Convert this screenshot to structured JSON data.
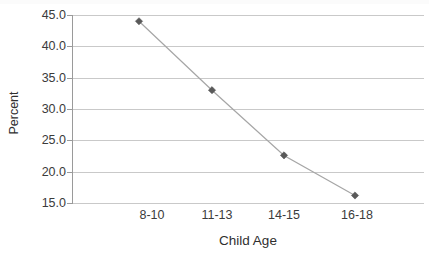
{
  "chart_data": {
    "type": "line",
    "title": "",
    "xlabel": "Child Age",
    "ylabel": "Percent",
    "categories": [
      "8-10",
      "11-13",
      "14-15",
      "16-18"
    ],
    "values": [
      44.0,
      33.0,
      22.6,
      16.2
    ],
    "series": [
      {
        "name": "Percent",
        "values": [
          44.0,
          33.0,
          22.6,
          16.2
        ]
      }
    ],
    "ylim": [
      15.0,
      45.0
    ],
    "ytick_labels": [
      "45.0",
      "40.0",
      "35.0",
      "30.0",
      "25.0",
      "20.0",
      "15.0"
    ],
    "ytick_values": [
      45.0,
      40.0,
      35.0,
      30.0,
      25.0,
      20.0,
      15.0
    ],
    "grid": "horizontal",
    "legend": "none",
    "marker": "diamond",
    "line_color": "#a6a6a6",
    "marker_color": "#595959",
    "gridline_color": "#c9c9c9",
    "axis_color": "#9a9a9a",
    "background": "#ffffff"
  }
}
